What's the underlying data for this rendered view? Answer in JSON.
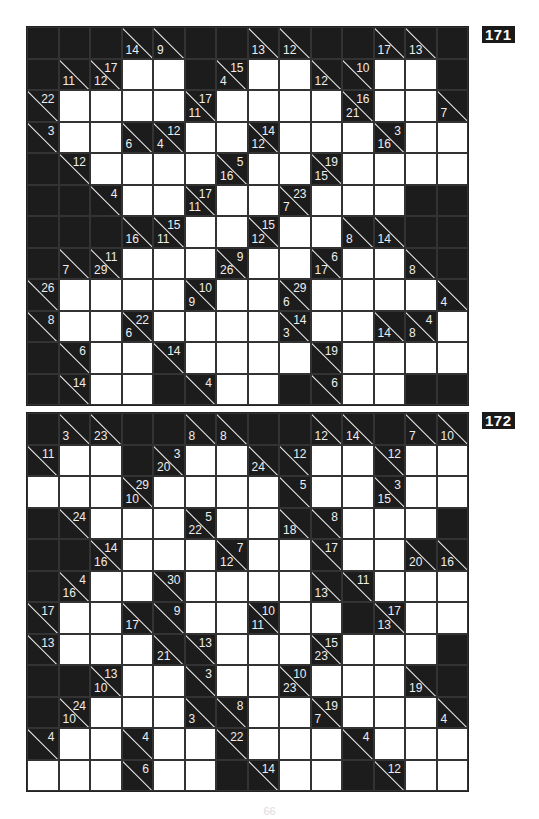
{
  "puzzles": [
    {
      "number": "171",
      "rows": [
        [
          "B",
          "B",
          "B",
          "14,",
          "9,",
          "B",
          "B",
          "13,",
          "12,",
          "B",
          "B",
          "17,",
          "13,",
          "B"
        ],
        [
          "B",
          "11,",
          "12,17",
          "W",
          "W",
          "B",
          "4,15",
          "W",
          "W",
          "12,",
          ",10",
          "W",
          "W",
          "B"
        ],
        [
          ",22",
          "W",
          "W",
          "W",
          "W",
          "11,17",
          "W",
          "W",
          "W",
          "W",
          "21,16",
          "W",
          "W",
          "7,"
        ],
        [
          ",3",
          "W",
          "W",
          "6,",
          "4,12",
          "W",
          "W",
          "12,14",
          "W",
          "W",
          "W",
          "16,3",
          "W",
          "W"
        ],
        [
          "B",
          ",12",
          "W",
          "W",
          "W",
          "W",
          "16,5",
          "W",
          "W",
          "15,19",
          "W",
          "W",
          "W",
          "W"
        ],
        [
          "B",
          "B",
          ",4",
          "W",
          "W",
          "11,17",
          "W",
          "W",
          "7,23",
          "W",
          "W",
          "W",
          "B",
          "B"
        ],
        [
          "B",
          "B",
          "B",
          "16,",
          "11,15",
          "W",
          "W",
          "12,15",
          "W",
          "W",
          "8,",
          "14,",
          "B",
          "B"
        ],
        [
          "B",
          "7,",
          "29,11",
          "W",
          "W",
          "W",
          "26,9",
          "W",
          "W",
          "17,6",
          "W",
          "W",
          "8,",
          "B"
        ],
        [
          ",26",
          "W",
          "W",
          "W",
          "W",
          "9,10",
          "W",
          "W",
          "6,29",
          "W",
          "W",
          "W",
          "W",
          "4,"
        ],
        [
          ",8",
          "W",
          "W",
          "6,22",
          "W",
          "W",
          "W",
          "W",
          "3,14",
          "W",
          "W",
          "14,",
          "8,4",
          "W"
        ],
        [
          "B",
          ",6",
          "W",
          "W",
          ",14",
          "W",
          "W",
          "W",
          "W",
          ",19",
          "W",
          "W",
          "W",
          "W"
        ],
        [
          "B",
          ",14",
          "W",
          "W",
          "B",
          ",4",
          "W",
          "W",
          "B",
          ",6",
          "W",
          "W",
          "B",
          "B"
        ]
      ]
    },
    {
      "number": "172",
      "rows": [
        [
          "B",
          "3,",
          "23,",
          "B",
          "B",
          "8,",
          "8,",
          "B",
          "B",
          "12,",
          "14,",
          "B",
          "7,",
          "10,"
        ],
        [
          ",11",
          "W",
          "W",
          "B",
          "20,3",
          "W",
          "W",
          "24,",
          ",12",
          "W",
          "W",
          ",12",
          "W",
          "W"
        ],
        [
          "W",
          "W",
          "W",
          "10,29",
          "W",
          "W",
          "W",
          "W",
          ",5",
          "W",
          "W",
          "15,3",
          "W",
          "W"
        ],
        [
          "B",
          ",24",
          "W",
          "W",
          "W",
          "22,5",
          "W",
          "W",
          "18,",
          ",8",
          "W",
          "W",
          "W",
          "B"
        ],
        [
          "B",
          "B",
          "16,14",
          "W",
          "W",
          "W",
          "12,7",
          "W",
          "W",
          ",17",
          "W",
          "W",
          "20,",
          "16,"
        ],
        [
          "B",
          "16,4",
          "W",
          "W",
          ",30",
          "W",
          "W",
          "W",
          "W",
          "13,",
          ",11",
          "W",
          "W",
          "W"
        ],
        [
          ",17",
          "W",
          "W",
          "17,",
          ",9",
          "W",
          "W",
          "11,10",
          "W",
          "W",
          "B",
          "13,17",
          "W",
          "W"
        ],
        [
          ",13",
          "W",
          "W",
          "W",
          "21,",
          ",13",
          "W",
          "W",
          "W",
          "23,15",
          "W",
          "W",
          "W",
          "B"
        ],
        [
          "B",
          "B",
          "10,13",
          "W",
          "W",
          ",3",
          "W",
          "W",
          "23,10",
          "W",
          "W",
          "W",
          "19,",
          "B"
        ],
        [
          "B",
          "10,24",
          "W",
          "W",
          "W",
          "3,",
          ",8",
          "W",
          "W",
          "7,19",
          "W",
          "W",
          "W",
          "4,"
        ],
        [
          ",4",
          "W",
          "W",
          ",4",
          "W",
          "W",
          ",22",
          "W",
          "W",
          "W",
          ",4",
          "W",
          "W",
          "W"
        ],
        [
          "W",
          "W",
          "W",
          ",6",
          "W",
          "W",
          "B",
          ",14",
          "W",
          "W",
          "B",
          ",12",
          "W",
          "W"
        ]
      ]
    }
  ],
  "page_number": "66"
}
